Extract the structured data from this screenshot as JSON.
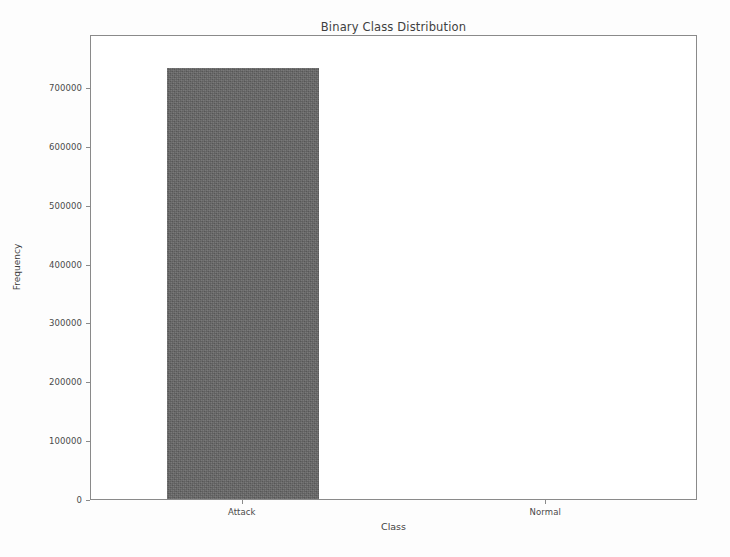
{
  "chart_data": {
    "type": "bar",
    "title": "Binary Class Distribution",
    "xlabel": "Class",
    "ylabel": "Frequency",
    "categories": [
      "Attack",
      "Normal"
    ],
    "values": [
      732000,
      0
    ],
    "series": [
      {
        "name": "Frequency",
        "values": [
          732000,
          0
        ]
      }
    ],
    "ylim": [
      0,
      790000
    ],
    "xlim": [
      -0.5,
      1.5
    ],
    "ytick_labels": [
      "0",
      "100000",
      "200000",
      "300000",
      "400000",
      "500000",
      "600000",
      "700000"
    ],
    "ytick_values": [
      0,
      100000,
      200000,
      300000,
      400000,
      500000,
      600000,
      700000
    ],
    "xtick_labels": [
      "Attack",
      "Normal"
    ],
    "grid": false,
    "legend": false,
    "legend_position": "none",
    "bar_color": "#646464",
    "axis_color": "#8a8a8a",
    "text_color": "#3f3f3f",
    "background_color": "#ffffff",
    "bar_width_fraction": 0.5
  }
}
